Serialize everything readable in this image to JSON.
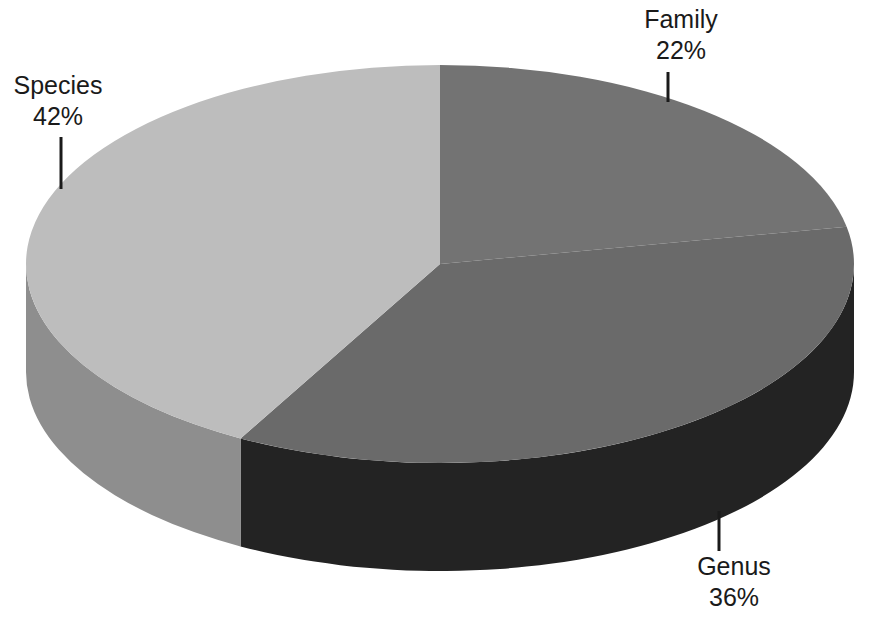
{
  "chart_data": {
    "type": "pie",
    "style": "3d",
    "title": "",
    "legend": "none",
    "start_angle_deg": 0,
    "direction": "clockwise",
    "background": "#ffffff",
    "label_color": "#1a1a1a",
    "slices": [
      {
        "name": "Family",
        "value": 22,
        "pct_label": "22%",
        "top_color": "#737373",
        "side_color": "#3a3a3a"
      },
      {
        "name": "Genus",
        "value": 36,
        "pct_label": "36%",
        "top_color": "#6a6a6a",
        "side_color": "#232323"
      },
      {
        "name": "Species",
        "value": 42,
        "pct_label": "42%",
        "top_color": "#bdbdbd",
        "side_color": "#8e8e8e"
      }
    ]
  }
}
